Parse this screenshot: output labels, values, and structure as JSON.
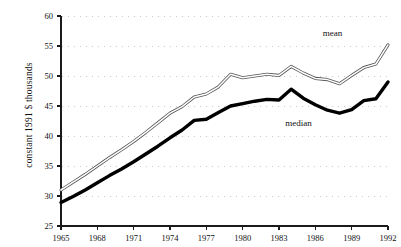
{
  "chart_data": {
    "type": "line",
    "title": "",
    "xlabel": "",
    "ylabel": "constant 1991 $ thousands",
    "xlim": [
      1965,
      1992
    ],
    "ylim": [
      25,
      60
    ],
    "grid": true,
    "grid_style": "dotted-horizontal",
    "legend_position": "inline-annotations",
    "x": [
      1965,
      1966,
      1967,
      1968,
      1969,
      1970,
      1971,
      1972,
      1973,
      1974,
      1975,
      1976,
      1977,
      1978,
      1979,
      1980,
      1981,
      1982,
      1983,
      1984,
      1985,
      1986,
      1987,
      1988,
      1989,
      1990,
      1991,
      1992
    ],
    "xtick_labels": [
      "1965",
      "1968",
      "1971",
      "1974",
      "1977",
      "1980",
      "1983",
      "1986",
      "1989",
      "1992"
    ],
    "xtick_values": [
      1965,
      1968,
      1971,
      1974,
      1977,
      1980,
      1983,
      1986,
      1989,
      1992
    ],
    "ytick_labels": [
      "25",
      "30",
      "35",
      "40",
      "45",
      "50",
      "55",
      "60"
    ],
    "ytick_values": [
      25,
      30,
      35,
      40,
      45,
      50,
      55,
      60
    ],
    "series": [
      {
        "name": "mean",
        "label": "mean",
        "style": "thin-outline",
        "color": "#4a4a4a",
        "label_x": 1987.6,
        "label_y": 57.0,
        "values": [
          31.0,
          32.1,
          33.3,
          34.3,
          35.1,
          36.1,
          37.3,
          38.6,
          40.0,
          41.4,
          42.8,
          44.3,
          46.8,
          47.6,
          48.6,
          50.3,
          49.5,
          49.9,
          50.2,
          50.0,
          51.6,
          50.6,
          49.6,
          48.7,
          49.4,
          51.4,
          52.2,
          55.2
        ],
        "values_by_year": {
          "1965": 31.0,
          "1966": 32.1,
          "1967": 33.3,
          "1968": 34.3,
          "1969": 35.1,
          "1970": 36.1,
          "1971": 37.3,
          "1972": 38.6,
          "1973": 40.0,
          "1974": 41.4,
          "1975": 42.8,
          "1976": 44.3,
          "1977": 46.8,
          "1978": 47.6,
          "1979": 48.6,
          "1980": 50.3,
          "1981": 49.5,
          "1982": 49.9,
          "1983": 50.2,
          "1984": 50.0,
          "1985": 51.6,
          "1986": 50.6,
          "1987": 49.6,
          "1988": 48.7,
          "1989": 49.4,
          "1990": 51.4,
          "1991": 52.2,
          "1992": 55.2
        },
        "plot_values": [
          31.0,
          32.3,
          33.6,
          34.9,
          36.2,
          37.5,
          38.9,
          40.3,
          41.7,
          43.2,
          44.8,
          46.9,
          47.6,
          48.6,
          50.3,
          49.5,
          49.9,
          50.2,
          50.0,
          51.6,
          50.6,
          49.6,
          48.7,
          49.4,
          51.4,
          52.2,
          55.2,
          52.7
        ]
      },
      {
        "name": "median",
        "label": "median",
        "style": "thick-solid",
        "color": "#000000",
        "label_x": 1985.0,
        "label_y": 42.0,
        "plot_values": [
          28.9,
          30.0,
          31.0,
          32.1,
          33.2,
          34.3,
          35.4,
          36.6,
          37.9,
          39.2,
          40.6,
          42.6,
          42.9,
          43.9,
          45.0,
          45.5,
          45.9,
          46.1,
          46.0,
          47.8,
          46.5,
          45.1,
          44.2,
          43.8,
          44.4,
          45.8,
          46.2,
          49.0
        ]
      }
    ],
    "series_plot": {
      "mean": [
        [
          1965,
          31.0
        ],
        [
          1966,
          32.3
        ],
        [
          1967,
          33.6
        ],
        [
          1968,
          35.0
        ],
        [
          1969,
          36.4
        ],
        [
          1970,
          37.7
        ],
        [
          1971,
          39.1
        ],
        [
          1972,
          40.6
        ],
        [
          1973,
          42.2
        ],
        [
          1974,
          43.8
        ],
        [
          1975,
          44.9
        ],
        [
          1976,
          46.5
        ],
        [
          1977,
          47.0
        ],
        [
          1978,
          48.2
        ],
        [
          1979,
          50.3
        ],
        [
          1980,
          49.7
        ],
        [
          1981,
          50.0
        ],
        [
          1982,
          50.3
        ],
        [
          1983,
          50.1
        ],
        [
          1984,
          51.6
        ],
        [
          1985,
          50.5
        ],
        [
          1986,
          49.6
        ],
        [
          1987,
          49.4
        ],
        [
          1988,
          48.7
        ],
        [
          1989,
          50.1
        ],
        [
          1990,
          51.4
        ],
        [
          1991,
          52.0
        ],
        [
          1992,
          55.2
        ]
      ],
      "median": [
        [
          1965,
          28.9
        ],
        [
          1966,
          29.9
        ],
        [
          1967,
          31.0
        ],
        [
          1968,
          32.2
        ],
        [
          1969,
          33.4
        ],
        [
          1970,
          34.5
        ],
        [
          1971,
          35.7
        ],
        [
          1972,
          37.0
        ],
        [
          1973,
          38.3
        ],
        [
          1974,
          39.7
        ],
        [
          1975,
          41.0
        ],
        [
          1976,
          42.6
        ],
        [
          1977,
          42.8
        ],
        [
          1978,
          43.9
        ],
        [
          1979,
          45.0
        ],
        [
          1980,
          45.4
        ],
        [
          1981,
          45.8
        ],
        [
          1982,
          46.1
        ],
        [
          1983,
          46.0
        ],
        [
          1984,
          47.8
        ],
        [
          1985,
          46.3
        ],
        [
          1986,
          45.2
        ],
        [
          1987,
          44.3
        ],
        [
          1988,
          43.8
        ],
        [
          1989,
          44.4
        ],
        [
          1990,
          45.9
        ],
        [
          1991,
          46.2
        ],
        [
          1992,
          49.0
        ]
      ]
    }
  },
  "annotations": {
    "mean_label": "mean",
    "median_label": "median"
  },
  "axes": {
    "y_title": "constant 1991 $ thousands",
    "y_ticks": [
      "60",
      "55",
      "50",
      "45",
      "40",
      "35",
      "30",
      "25"
    ],
    "x_ticks": [
      "1965",
      "1968",
      "1971",
      "1974",
      "1977",
      "1980",
      "1983",
      "1986",
      "1989",
      "1992"
    ]
  },
  "colors": {
    "axis": "#1a1a1a",
    "grid": "#c9c9c9",
    "median_line": "#000000",
    "mean_line_fill": "#ffffff",
    "mean_line_stroke": "#555555",
    "background": "#ffffff"
  }
}
